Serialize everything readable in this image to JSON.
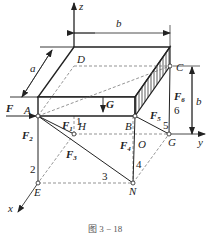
{
  "figure": {
    "caption": "图 3 − 18",
    "axes": {
      "x": "x",
      "y": "y",
      "z": "z"
    },
    "points": {
      "A": "A",
      "B": "B",
      "C": "C",
      "D": "D",
      "E": "E",
      "G": "G",
      "H": "H",
      "N": "N",
      "O": "O"
    },
    "dimensions": {
      "a": "a",
      "b_top": "b",
      "b_right": "b"
    },
    "forces": {
      "F": "F",
      "G": "G",
      "F1": {
        "base": "F",
        "sub": "1"
      },
      "F2": {
        "base": "F",
        "sub": "2"
      },
      "F3": {
        "base": "F",
        "sub": "3"
      },
      "F4": {
        "base": "F",
        "sub": "4"
      },
      "F5": {
        "base": "F",
        "sub": "5"
      },
      "F6": {
        "base": "F",
        "sub": "6"
      }
    },
    "rod_numbers": [
      "1",
      "2",
      "3",
      "4",
      "5",
      "6"
    ]
  }
}
